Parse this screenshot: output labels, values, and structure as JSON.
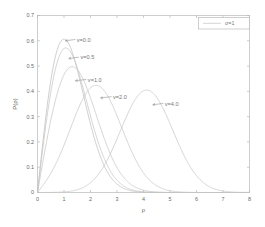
{
  "chart_data": {
    "type": "line",
    "title": "",
    "xlabel": "ρ",
    "ylabel": "P(ρ)",
    "xlim": [
      0,
      8
    ],
    "ylim": [
      0,
      0.7
    ],
    "xticks": [
      "0",
      "1",
      "2",
      "3",
      "4",
      "5",
      "6",
      "7",
      "8"
    ],
    "xtick_values": [
      0,
      1,
      2,
      3,
      4,
      5,
      6,
      7,
      8
    ],
    "yticks": [
      "0",
      "0.1",
      "0.2",
      "0.3",
      "0.4",
      "0.5",
      "0.6",
      "0.7"
    ],
    "ytick_values": [
      0,
      0.1,
      0.2,
      0.3,
      0.4,
      0.5,
      0.6,
      0.7
    ],
    "grid": false,
    "legend_position": "top-right",
    "legend_entries": [
      "σ=1"
    ],
    "distribution": "Rice (Rician) probability density function",
    "sigma": 1,
    "series": [
      {
        "name": "v=0.0",
        "v": 0.0,
        "color": "#bdbdbd",
        "peak_x": 1.0,
        "peak_y": 0.6065,
        "label_x": 1.48,
        "label_y": 0.598,
        "leader_from_x": 1.05,
        "leader_from_y": 0.6,
        "x": [
          0,
          0.2,
          0.4,
          0.6,
          0.8,
          1.0,
          1.2,
          1.4,
          1.6,
          1.8,
          2.0,
          2.4,
          2.8,
          3.2,
          3.6,
          4.0,
          4.5,
          5.0,
          5.5,
          6.0,
          7.0,
          8.0
        ],
        "y": [
          0,
          0.196,
          0.369,
          0.502,
          0.58,
          0.607,
          0.587,
          0.533,
          0.46,
          0.381,
          0.271,
          0.16,
          0.0559,
          0.0208,
          0.00712,
          0.00134,
          0.00019,
          1.87e-05,
          1.3e-06,
          7e-08,
          0,
          0
        ]
      },
      {
        "name": "v=0.5",
        "v": 0.5,
        "color": "#c6c6c6",
        "peak_x": 1.12,
        "peak_y": 0.5852,
        "label_x": 1.62,
        "label_y": 0.528,
        "leader_from_x": 1.18,
        "leader_from_y": 0.53,
        "x": [
          0,
          0.2,
          0.4,
          0.6,
          0.8,
          1.0,
          1.2,
          1.4,
          1.6,
          1.8,
          2.0,
          2.4,
          2.8,
          3.2,
          3.6,
          4.0,
          4.5,
          5.0,
          5.5,
          6.0,
          7.0,
          8.0
        ],
        "y": [
          0,
          0.177,
          0.341,
          0.474,
          0.557,
          0.584,
          0.561,
          0.504,
          0.428,
          0.348,
          0.272,
          0.146,
          0.0646,
          0.0239,
          0.00759,
          0.00203,
          0.000302,
          3.16e-05,
          2.3e-06,
          1e-07,
          0,
          0
        ]
      },
      {
        "name": "v=1.0",
        "v": 1.0,
        "color": "#c6c6c6",
        "peak_x": 1.28,
        "peak_y": 0.4971,
        "label_x": 1.9,
        "label_y": 0.44,
        "leader_from_x": 1.43,
        "leader_from_y": 0.442,
        "x": [
          0,
          0.2,
          0.4,
          0.6,
          0.8,
          1.0,
          1.2,
          1.4,
          1.6,
          1.8,
          2.0,
          2.4,
          2.8,
          3.2,
          3.6,
          4.0,
          4.5,
          5.0,
          5.5,
          6.0,
          7.0,
          8.0
        ],
        "y": [
          0,
          0.13,
          0.258,
          0.373,
          0.455,
          0.489,
          0.496,
          0.47,
          0.421,
          0.358,
          0.29,
          0.17,
          0.0846,
          0.0357,
          0.0128,
          0.00392,
          0.000705,
          9.37e-05,
          9e-06,
          6e-07,
          0,
          0
        ]
      },
      {
        "name": "v=2.0",
        "v": 2.0,
        "color": "#c6c6c6",
        "peak_x": 2.23,
        "peak_y": 0.4201,
        "label_x": 2.85,
        "label_y": 0.372,
        "leader_from_x": 2.38,
        "leader_from_y": 0.374,
        "x": [
          0,
          0.2,
          0.4,
          0.6,
          0.8,
          1.0,
          1.2,
          1.4,
          1.6,
          1.8,
          2.0,
          2.2,
          2.4,
          2.6,
          2.8,
          3.2,
          3.6,
          4.0,
          4.5,
          5.0,
          5.5,
          6.0,
          7.0,
          8.0
        ],
        "y": [
          0,
          0.0393,
          0.0847,
          0.138,
          0.196,
          0.255,
          0.309,
          0.355,
          0.389,
          0.41,
          0.419,
          0.42,
          0.409,
          0.388,
          0.357,
          0.276,
          0.188,
          0.112,
          0.0445,
          0.0139,
          0.0034,
          0.000655,
          1.07e-05,
          0
        ]
      },
      {
        "name": "v=4.0",
        "v": 4.0,
        "color": "#c6c6c6",
        "peak_x": 4.12,
        "peak_y": 0.4029,
        "label_x": 4.8,
        "label_y": 0.345,
        "leader_from_x": 4.35,
        "leader_from_y": 0.347,
        "x": [
          0,
          0.5,
          1.0,
          1.5,
          2.0,
          2.4,
          2.8,
          3.2,
          3.6,
          4.0,
          4.4,
          4.8,
          5.2,
          5.6,
          6.0,
          6.4,
          6.8,
          7.2,
          7.6,
          8.0
        ],
        "y": [
          0,
          0.00378,
          0.0217,
          0.0577,
          0.113,
          0.171,
          0.234,
          0.294,
          0.345,
          0.381,
          0.398,
          0.392,
          0.365,
          0.32,
          0.263,
          0.201,
          0.142,
          0.0918,
          0.0541,
          0.0291
        ]
      }
    ],
    "annotations": [
      {
        "text": "v=0.0"
      },
      {
        "text": "v=0.5"
      },
      {
        "text": "v=1.0"
      },
      {
        "text": "v=2.0"
      },
      {
        "text": "v=4.0"
      }
    ],
    "colors": {
      "frame": "#b9b9b9",
      "curve": "#c6c6c6",
      "text": "#6a6a6a",
      "background": "#ffffff"
    }
  },
  "figure": {
    "legend": {
      "label": "σ=1"
    },
    "axes": {
      "xlabel": "ρ",
      "ylabel": "P(ρ)"
    },
    "xticks": {
      "t0": "0",
      "t1": "1",
      "t2": "2",
      "t3": "3",
      "t4": "4",
      "t5": "5",
      "t6": "6",
      "t7": "7",
      "t8": "8"
    },
    "yticks": {
      "t0": "0",
      "t1": "0.1",
      "t2": "0.2",
      "t3": "0.3",
      "t4": "0.4",
      "t5": "0.5",
      "t6": "0.6",
      "t7": "0.7"
    },
    "labels": {
      "v0": "v=0.0",
      "v05": "v=0.5",
      "v1": "v=1.0",
      "v2": "v=2.0",
      "v4": "v=4.0"
    }
  }
}
